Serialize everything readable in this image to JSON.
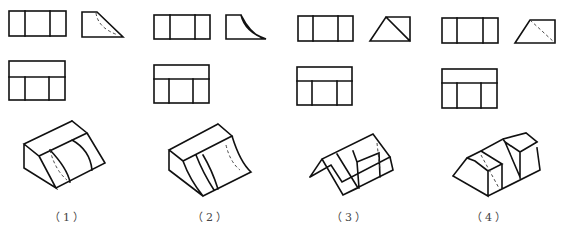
{
  "figure": {
    "stroke_color": "#111111",
    "background": "#ffffff",
    "problems": [
      {
        "label": "（1）",
        "label_pos": [
          68,
          218
        ],
        "front_view": {
          "rect": [
            9,
            11,
            57,
            25
          ],
          "verticals": [
            25,
            50
          ]
        },
        "side_view": {
          "solid": "M82 12 L97 12 L123 37 L82 37 Z",
          "hidden": "M96 13 Q98 28 118 35"
        },
        "top_view": {
          "rect": [
            9,
            61,
            56,
            39
          ],
          "hline": 77,
          "verticals": [
            25,
            49
          ]
        },
        "isometric": {
          "solid": "M24 144 L72 121 L87 133 L39 156 Z M24 144 L24 168 L56 188 L39 156 M56 188 L105 163 L87 133 M72 121 L87 133 M50 150 Q67 168 70 182 M72 140 Q90 150 92 170",
          "hidden": "M50 150 Q55 170 67 180"
        }
      },
      {
        "label": "（2）",
        "label_pos": [
          211,
          218
        ],
        "front_view": {
          "rect": [
            154,
            15,
            56,
            24
          ],
          "verticals": [
            170,
            195
          ]
        },
        "side_view": {
          "solid": "M226 15 L241 15 Q245 32 266 39 L226 39 Z M241 15 Q250 33 262 38"
        },
        "top_view": {
          "rect": [
            154,
            65,
            55,
            38
          ],
          "hline": 79,
          "verticals": [
            169,
            193
          ]
        },
        "isometric": {
          "solid": "M169 150 L218 124 L232 136 L183 161 Z M169 150 L169 170 L203 196 M183 161 Q190 180 203 196 M203 196 L251 172 Q240 162 232 136 M218 124 L232 136 M196 155 Q203 173 214 190 M203 155 Q212 170 218 189",
          "hidden": "M226 145 Q230 162 240 170"
        }
      },
      {
        "label": "（3）",
        "label_pos": [
          350,
          218
        ],
        "front_view": {
          "rect": [
            298,
            16,
            55,
            25
          ],
          "verticals": [
            313,
            338
          ]
        },
        "side_view": {
          "solid": "M370 41 L386 17 L410 17 L410 41 Z M386 17 L410 41"
        },
        "top_view": {
          "rect": [
            297,
            67,
            55,
            38
          ],
          "hline": 81,
          "verticals": [
            312,
            337
          ]
        },
        "isometric": {
          "solid": "M310 177 L322 159 L373 134 L390 157 L342 182 L331 165 L310 177 M322 159 L343 195 L358 188 L337 154 M343 195 L393 170 L390 157 M353 151 L357 162 L359 188 M357 162 L379 153 L380 177",
          "hidden": "M377 143 L380 170"
        }
      },
      {
        "label": "（4）",
        "label_pos": [
          490,
          218
        ],
        "front_view": {
          "rect": [
            442,
            18,
            56,
            25
          ],
          "verticals": [
            457,
            483
          ]
        },
        "side_view": {
          "solid": "M515 43 L530 20 L555 20 L555 43 Z",
          "hidden": "M530 20 L555 43"
        },
        "top_view": {
          "rect": [
            442,
            69,
            55,
            39
          ],
          "hline": 83,
          "verticals": [
            457,
            481
          ]
        },
        "isometric": {
          "solid": "M453 176 L467 158 L481 151 L502 164 L488 171 L475 161 L467 158 M453 176 L488 196 L488 171 M488 196 L540 170 L537 148 M481 151 L503 139 L505 142 M503 139 L526 133 L537 142 L520 152 L520 178 M505 142 L520 152 L537 142 M505 142 L520 177 M502 164 L502 189",
          "hidden": "M481 155 L500 190"
        }
      }
    ]
  }
}
